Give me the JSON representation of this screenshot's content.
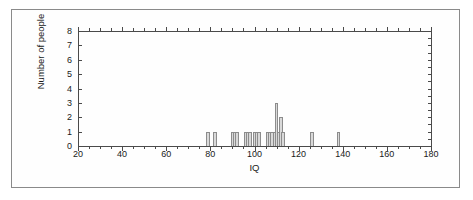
{
  "chart_data": {
    "type": "bar",
    "title": "",
    "xlabel": "IQ",
    "ylabel": "Number of people",
    "xlim": [
      20,
      180
    ],
    "ylim": [
      0,
      8
    ],
    "xticks": [
      20,
      40,
      60,
      80,
      100,
      120,
      140,
      160,
      180
    ],
    "yticks": [
      0,
      1,
      2,
      3,
      4,
      5,
      6,
      7,
      8
    ],
    "xtick_labels": [
      "20",
      "40",
      "60",
      "80",
      "100",
      "120",
      "140",
      "160",
      "180"
    ],
    "ytick_labels": [
      "0",
      "1",
      "2",
      "3",
      "4",
      "5",
      "6",
      "7",
      "8"
    ],
    "x_minor_tick_step": 5,
    "grid": false,
    "legend": null,
    "bar_width_iq": 1.6,
    "bar_fill": "#d9d9d9",
    "bar_edge": "#8c8c8c",
    "axis_color": "#4a4a4a",
    "frame_color": "#8a8a8a",
    "x": [
      79,
      82,
      90,
      91,
      92,
      96,
      97,
      98,
      100,
      101,
      102,
      106,
      107,
      108,
      109,
      110,
      111,
      112,
      113,
      126,
      138
    ],
    "values": [
      1,
      1,
      1,
      1,
      1,
      1,
      1,
      1,
      1,
      1,
      1,
      1,
      1,
      1,
      1,
      3,
      1,
      2,
      1,
      1,
      1
    ],
    "categories": [
      "79",
      "82",
      "90",
      "91",
      "92",
      "96",
      "97",
      "98",
      "100",
      "101",
      "102",
      "106",
      "107",
      "108",
      "109",
      "110",
      "111",
      "112",
      "113",
      "126",
      "138"
    ]
  },
  "figure": {
    "x_axis_title": "IQ",
    "y_axis_title": "Number of people"
  }
}
